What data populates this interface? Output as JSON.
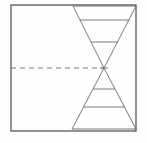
{
  "figure": {
    "title": "",
    "background_color": "#fefefe",
    "width": 147,
    "height": 143
  },
  "colors": {
    "frame_stroke": "#4a4a4a",
    "triangle_stroke": "#6b6b6b",
    "crossbar_stroke": "#6b6b6b",
    "dashed_stroke": "#6b6b6b",
    "fill": "none"
  },
  "strokes": {
    "frame_width": 1.2,
    "triangle_width": 0.9,
    "crossbar_width": 0.9,
    "dashed_width": 0.9,
    "dash_pattern": "5 4"
  },
  "frame": {
    "name": "outer-rectangle",
    "x": 11,
    "y": 5,
    "width": 125,
    "height": 126
  },
  "centerline": {
    "name": "dashed-centerline",
    "x1": 11,
    "y1": 68,
    "x2": 104,
    "y2": 68,
    "style": "dashed"
  },
  "upper_triangle": {
    "name": "upper-triangle",
    "orientation": "pointing-down",
    "points": "73,6 136,6 104,68",
    "apex": {
      "x": 104,
      "y": 68
    },
    "base_y": 6,
    "base_left_x": 73,
    "base_right_x": 136,
    "crossbars": [
      {
        "y": 20,
        "x1": 80,
        "x2": 129
      },
      {
        "y": 42,
        "x1": 91,
        "x2": 118
      }
    ]
  },
  "lower_triangle": {
    "name": "lower-triangle",
    "orientation": "pointing-up",
    "points": "104,68 136,129 72,129",
    "apex": {
      "x": 104,
      "y": 68
    },
    "base_y": 129,
    "base_left_x": 72,
    "base_right_x": 136,
    "crossbars": [
      {
        "y": 89,
        "x1": 93,
        "x2": 115
      },
      {
        "y": 107,
        "x1": 84,
        "x2": 125
      }
    ]
  },
  "apex_marker": {
    "name": "apex-connector",
    "x1": 100,
    "y1": 68,
    "x2": 108,
    "y2": 68
  }
}
